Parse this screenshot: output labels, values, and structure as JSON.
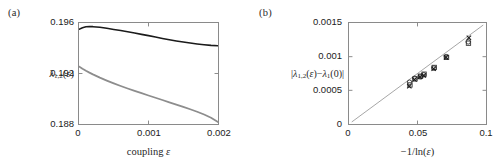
{
  "figure": {
    "panels": [
      {
        "id": "a",
        "label": "(a)",
        "xlabel_html": "coupling",
        "xlabel_symbol": "ε",
        "ylabel_base": "λ",
        "ylabel_sub": "1,2",
        "ylabel_arg": "(ε)"
      },
      {
        "id": "b",
        "label": "(b)",
        "xlabel_html": "−1/ln(ε)",
        "ylabel_html": "|λ1,2(ε)−λ1(0)|"
      }
    ]
  },
  "chart_data": [
    {
      "type": "line",
      "panel": "a",
      "title": "(a)",
      "xlabel": "coupling ε",
      "ylabel": "λ_{1,2}(ε)",
      "xlim": [
        0,
        0.002
      ],
      "ylim": [
        0.188,
        0.196
      ],
      "xticks": [
        0,
        0.001,
        0.002
      ],
      "xticklabels": [
        "0",
        "0.001",
        "0.002"
      ],
      "yticks": [
        0.188,
        0.192,
        0.196
      ],
      "yticklabels": [
        "0.188",
        "0.192",
        "0.196"
      ],
      "grid": false,
      "legend": "none",
      "series": [
        {
          "name": "lambda_1",
          "color": "#1b1b1b",
          "linewidth": 1.6,
          "x": [
            0.0,
            5e-05,
            0.0001,
            0.00015,
            0.0002,
            0.0003,
            0.0004,
            0.0005,
            0.0006,
            0.0007,
            0.0008,
            0.0009,
            0.001,
            0.0011,
            0.0012,
            0.0013,
            0.0014,
            0.0015,
            0.0016,
            0.0017,
            0.0018,
            0.0019,
            0.002
          ],
          "y": [
            0.1955,
            0.19562,
            0.1957,
            0.19572,
            0.19571,
            0.19566,
            0.19558,
            0.19549,
            0.1954,
            0.1953,
            0.1952,
            0.1951,
            0.195,
            0.19489,
            0.19478,
            0.19468,
            0.19458,
            0.19449,
            0.19441,
            0.19434,
            0.19428,
            0.19423,
            0.1942
          ]
        },
        {
          "name": "lambda_2",
          "color": "#8d8d8d",
          "linewidth": 1.8,
          "x": [
            0.0,
            5e-05,
            0.0001,
            0.00015,
            0.0002,
            0.0003,
            0.0004,
            0.0005,
            0.0006,
            0.0007,
            0.0008,
            0.0009,
            0.001,
            0.0011,
            0.0012,
            0.0013,
            0.0014,
            0.0015,
            0.0016,
            0.0017,
            0.0018,
            0.0019,
            0.002
          ],
          "y": [
            0.19255,
            0.19238,
            0.19222,
            0.19207,
            0.19193,
            0.19167,
            0.19144,
            0.19122,
            0.19101,
            0.19081,
            0.19062,
            0.19044,
            0.19026,
            0.19008,
            0.1899,
            0.18972,
            0.18954,
            0.18936,
            0.18917,
            0.18897,
            0.18875,
            0.1885,
            0.18815
          ]
        }
      ]
    },
    {
      "type": "scatter",
      "panel": "b",
      "title": "(b)",
      "xlabel": "−1/ln(ε)",
      "ylabel": "|λ_{1,2}(ε)−λ_1(0)|",
      "xlim": [
        0,
        0.1
      ],
      "ylim": [
        0,
        0.0015
      ],
      "xticks": [
        0,
        0.05,
        0.1
      ],
      "xticklabels": [
        "0",
        "0.05",
        "0.1"
      ],
      "yticks": [
        0,
        0.0005,
        0.001,
        0.0015
      ],
      "yticklabels": [
        "0",
        "0.0005",
        "0.001",
        "0.0015"
      ],
      "grid": false,
      "legend": "none",
      "fit_line": {
        "name": "linear-fit",
        "color": "#9a9a9a",
        "x": [
          0.002,
          0.098
        ],
        "y": [
          3e-05,
          0.00147
        ],
        "slope": 0.015,
        "intercept": 0.0
      },
      "series": [
        {
          "name": "circle-markers",
          "marker": "circle",
          "color": "#333333",
          "filled": false,
          "x": [
            0.0442,
            0.048,
            0.052,
            0.0545,
            0.062,
            0.071,
            0.087
          ],
          "y": [
            0.00062,
            0.00068,
            0.0007,
            0.00073,
            0.00083,
            0.001,
            0.00122
          ]
        },
        {
          "name": "square-markers",
          "marker": "square",
          "color": "#333333",
          "filled": false,
          "x": [
            0.0445,
            0.0482,
            0.0522,
            0.0548,
            0.0622,
            0.0712,
            0.0872
          ],
          "y": [
            0.00058,
            0.00067,
            0.00071,
            0.00074,
            0.00084,
            0.00099,
            0.0012
          ]
        },
        {
          "name": "cross-markers",
          "marker": "x",
          "color": "#1b1b1b",
          "filled": true,
          "x": [
            0.044,
            0.0478,
            0.0518,
            0.0546,
            0.0618,
            0.0708,
            0.0875
          ],
          "y": [
            0.00056,
            0.00066,
            0.0007,
            0.00072,
            0.00082,
            0.00099,
            0.00128
          ]
        }
      ]
    }
  ]
}
